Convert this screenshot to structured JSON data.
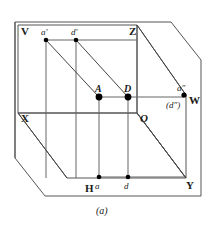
{
  "figure": {
    "caption": "(a)",
    "type": "descriptive-geometry-projection-box",
    "stroke_color": "#444444",
    "point_color": "#000000",
    "background": "#ffffff"
  },
  "planes": [
    {
      "id": "V",
      "label": "V",
      "x": 21,
      "y": 26
    },
    {
      "id": "Z",
      "label": "Z",
      "x": 129,
      "y": 26
    },
    {
      "id": "X",
      "label": "X",
      "x": 21,
      "y": 113
    },
    {
      "id": "O",
      "label": "O",
      "x": 140,
      "y": 113
    },
    {
      "id": "W",
      "label": "W",
      "x": 189,
      "y": 95
    },
    {
      "id": "Y",
      "label": "Y",
      "x": 186,
      "y": 180
    },
    {
      "id": "H",
      "label": "H",
      "x": 85,
      "y": 183
    }
  ],
  "points": [
    {
      "id": "a-prime",
      "label": "a′",
      "cx": 46,
      "cy": 40,
      "lx": 41,
      "ly": 28,
      "dot": true
    },
    {
      "id": "d-prime",
      "label": "d′",
      "cx": 76,
      "cy": 40,
      "lx": 71,
      "ly": 28,
      "dot": true
    },
    {
      "id": "A",
      "label": "A",
      "cx": 99,
      "cy": 97,
      "lx": 95,
      "ly": 84,
      "dot": true
    },
    {
      "id": "D",
      "label": "D",
      "cx": 128,
      "cy": 97,
      "lx": 124,
      "ly": 84,
      "dot": true
    },
    {
      "id": "a-double",
      "label": "a″",
      "cx": 184,
      "cy": 95,
      "lx": 177,
      "ly": 84,
      "dot": true
    },
    {
      "id": "d-double",
      "label": "(d″)",
      "cx": 184,
      "cy": 95,
      "lx": 166,
      "ly": 101,
      "dot": false
    },
    {
      "id": "a",
      "label": "a",
      "cx": 99,
      "cy": 177,
      "lx": 95,
      "ly": 182,
      "dot": true
    },
    {
      "id": "d",
      "label": "d",
      "cx": 128,
      "cy": 177,
      "lx": 124,
      "ly": 182,
      "dot": true
    }
  ],
  "geometry": {
    "outer_frame": "M15,22 L171,22 L201,60 L201,196 L45,196 L15,158 Z",
    "v_plane_rect": "M18,25 L137,25 L137,113 L18,113 Z",
    "h_plane_quad": "M18,113 L137,113 L186,178 L67,178 Z",
    "w_plane_quad": "M137,25 L186,95 L186,178 L137,113 Z",
    "inner_box_top": "M46,40 L137,40",
    "inner_vert_left": "M46,40 L46,178",
    "inner_vert_mid": "M76,40 L76,178",
    "inner_vert_A": "M99,97 L99,177",
    "inner_vert_D": "M128,97 L128,177",
    "inner_horiz_AD": "M99,97 L184,97",
    "diag_Z_W": "M137,25 L186,95",
    "diag_aprime_A": "M46,40 L99,97",
    "diag_dprime_D": "M76,40 L128,97",
    "diag_X_H": "M18,113 L67,178",
    "diag_O_Y": "M137,113 L186,178",
    "bottom_line_ad": "M99,177 L186,177"
  },
  "caption_pos": {
    "x": 96,
    "y": 206
  }
}
